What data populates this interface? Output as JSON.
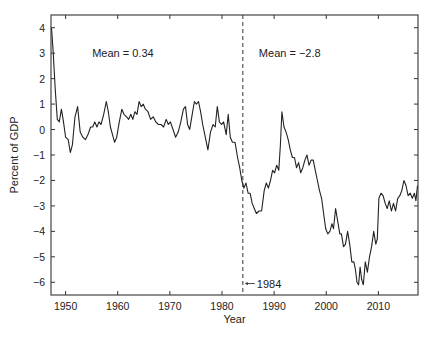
{
  "chart_data": {
    "type": "line",
    "title": "",
    "xlabel": "Year",
    "ylabel": "Percent of GDP",
    "xlim": [
      1947.2,
      2017.6
    ],
    "ylim": [
      -6.5,
      4.5
    ],
    "xticks": [
      1950,
      1960,
      1970,
      1980,
      1990,
      2000,
      2010
    ],
    "yticks": [
      4,
      3,
      2,
      1,
      0,
      -1,
      -2,
      -3,
      -4,
      -5,
      -6
    ],
    "grid": false,
    "legend": null,
    "annotations": [
      {
        "text": "Mean = 0.34",
        "x": 1961,
        "y": 2.85
      },
      {
        "text": "Mean = −2.8",
        "x": 1993,
        "y": 2.85
      },
      {
        "text": "1984",
        "x": 1984.3,
        "y": -6.05,
        "arrow": true
      }
    ],
    "vline": {
      "x": 1984,
      "style": "dashed"
    },
    "series": [
      {
        "name": "Percent of GDP",
        "color": "#222222",
        "points": [
          [
            1947.3,
            4.0
          ],
          [
            1947.6,
            3.1
          ],
          [
            1948.0,
            1.6
          ],
          [
            1948.4,
            0.4
          ],
          [
            1948.8,
            0.3
          ],
          [
            1949.2,
            0.8
          ],
          [
            1949.6,
            0.3
          ],
          [
            1950.0,
            -0.3
          ],
          [
            1950.5,
            -0.4
          ],
          [
            1950.9,
            -0.9
          ],
          [
            1951.3,
            -0.6
          ],
          [
            1951.8,
            0.5
          ],
          [
            1952.3,
            0.9
          ],
          [
            1952.8,
            -0.1
          ],
          [
            1953.3,
            -0.3
          ],
          [
            1953.8,
            -0.4
          ],
          [
            1954.3,
            -0.2
          ],
          [
            1954.8,
            0.1
          ],
          [
            1955.2,
            0.1
          ],
          [
            1955.6,
            0.3
          ],
          [
            1956.0,
            0.1
          ],
          [
            1956.4,
            0.3
          ],
          [
            1956.8,
            0.2
          ],
          [
            1957.3,
            0.6
          ],
          [
            1957.8,
            1.1
          ],
          [
            1958.2,
            0.7
          ],
          [
            1958.6,
            0.1
          ],
          [
            1959.0,
            -0.2
          ],
          [
            1959.4,
            -0.5
          ],
          [
            1959.8,
            -0.3
          ],
          [
            1960.3,
            0.3
          ],
          [
            1960.8,
            0.8
          ],
          [
            1961.2,
            0.6
          ],
          [
            1961.7,
            0.5
          ],
          [
            1962.1,
            0.4
          ],
          [
            1962.5,
            0.6
          ],
          [
            1962.9,
            0.4
          ],
          [
            1963.3,
            0.7
          ],
          [
            1963.7,
            0.6
          ],
          [
            1964.1,
            1.1
          ],
          [
            1964.5,
            0.9
          ],
          [
            1964.9,
            1.0
          ],
          [
            1965.3,
            0.8
          ],
          [
            1965.8,
            0.7
          ],
          [
            1966.3,
            0.4
          ],
          [
            1966.8,
            0.5
          ],
          [
            1967.3,
            0.3
          ],
          [
            1967.8,
            0.2
          ],
          [
            1968.3,
            0.2
          ],
          [
            1968.8,
            0.1
          ],
          [
            1969.3,
            0.4
          ],
          [
            1969.7,
            0.2
          ],
          [
            1970.1,
            0.3
          ],
          [
            1970.6,
            0.0
          ],
          [
            1971.1,
            -0.3
          ],
          [
            1971.6,
            -0.1
          ],
          [
            1972.1,
            0.3
          ],
          [
            1972.6,
            0.8
          ],
          [
            1973.0,
            0.9
          ],
          [
            1973.4,
            0.2
          ],
          [
            1973.8,
            0.0
          ],
          [
            1974.2,
            0.5
          ],
          [
            1974.7,
            1.1
          ],
          [
            1975.1,
            1.0
          ],
          [
            1975.5,
            1.1
          ],
          [
            1975.9,
            0.7
          ],
          [
            1976.3,
            0.2
          ],
          [
            1976.8,
            -0.3
          ],
          [
            1977.3,
            -0.8
          ],
          [
            1977.8,
            -0.1
          ],
          [
            1978.3,
            0.2
          ],
          [
            1978.7,
            0.1
          ],
          [
            1979.1,
            0.9
          ],
          [
            1979.5,
            0.3
          ],
          [
            1979.9,
            0.2
          ],
          [
            1980.3,
            0.3
          ],
          [
            1980.8,
            -0.2
          ],
          [
            1981.2,
            0.6
          ],
          [
            1981.6,
            -0.3
          ],
          [
            1982.0,
            -0.5
          ],
          [
            1982.5,
            -0.5
          ],
          [
            1983.0,
            -1.1
          ],
          [
            1983.4,
            -1.5
          ],
          [
            1983.8,
            -2.0
          ],
          [
            1984.2,
            -2.3
          ],
          [
            1984.6,
            -2.1
          ],
          [
            1985.0,
            -2.5
          ],
          [
            1985.4,
            -2.5
          ],
          [
            1985.8,
            -2.9
          ],
          [
            1986.2,
            -3.1
          ],
          [
            1986.6,
            -3.3
          ],
          [
            1987.1,
            -3.2
          ],
          [
            1987.6,
            -3.2
          ],
          [
            1988.1,
            -2.4
          ],
          [
            1988.5,
            -2.1
          ],
          [
            1988.9,
            -2.3
          ],
          [
            1989.3,
            -2.0
          ],
          [
            1989.7,
            -1.6
          ],
          [
            1990.1,
            -1.7
          ],
          [
            1990.5,
            -1.4
          ],
          [
            1990.9,
            -1.6
          ],
          [
            1991.2,
            -0.6
          ],
          [
            1991.5,
            0.7
          ],
          [
            1991.9,
            0.1
          ],
          [
            1992.3,
            -0.1
          ],
          [
            1992.7,
            -0.4
          ],
          [
            1993.1,
            -0.8
          ],
          [
            1993.5,
            -1.1
          ],
          [
            1993.9,
            -1.1
          ],
          [
            1994.3,
            -1.5
          ],
          [
            1994.7,
            -1.3
          ],
          [
            1995.1,
            -1.7
          ],
          [
            1995.5,
            -1.5
          ],
          [
            1995.9,
            -1.2
          ],
          [
            1996.3,
            -1.0
          ],
          [
            1996.7,
            -1.4
          ],
          [
            1997.1,
            -1.2
          ],
          [
            1997.5,
            -1.2
          ],
          [
            1997.9,
            -1.6
          ],
          [
            1998.3,
            -2.0
          ],
          [
            1998.7,
            -2.4
          ],
          [
            1999.1,
            -2.7
          ],
          [
            1999.5,
            -3.3
          ],
          [
            1999.9,
            -3.9
          ],
          [
            2000.3,
            -4.1
          ],
          [
            2000.7,
            -4.0
          ],
          [
            2001.1,
            -3.7
          ],
          [
            2001.4,
            -3.9
          ],
          [
            2001.8,
            -3.1
          ],
          [
            2002.2,
            -3.6
          ],
          [
            2002.6,
            -4.1
          ],
          [
            2002.9,
            -4.1
          ],
          [
            2003.3,
            -4.6
          ],
          [
            2003.7,
            -4.5
          ],
          [
            2004.1,
            -4.0
          ],
          [
            2004.5,
            -4.5
          ],
          [
            2004.9,
            -5.2
          ],
          [
            2005.3,
            -5.2
          ],
          [
            2005.6,
            -5.5
          ],
          [
            2005.9,
            -6.0
          ],
          [
            2006.2,
            -6.1
          ],
          [
            2006.5,
            -5.4
          ],
          [
            2006.8,
            -5.9
          ],
          [
            2007.1,
            -6.1
          ],
          [
            2007.5,
            -5.2
          ],
          [
            2007.9,
            -5.6
          ],
          [
            2008.3,
            -5.0
          ],
          [
            2008.7,
            -4.6
          ],
          [
            2009.1,
            -4.0
          ],
          [
            2009.5,
            -4.5
          ],
          [
            2009.8,
            -4.3
          ],
          [
            2010.1,
            -2.7
          ],
          [
            2010.5,
            -2.5
          ],
          [
            2010.9,
            -2.6
          ],
          [
            2011.3,
            -2.9
          ],
          [
            2011.7,
            -3.1
          ],
          [
            2012.1,
            -2.8
          ],
          [
            2012.5,
            -3.2
          ],
          [
            2012.9,
            -2.9
          ],
          [
            2013.3,
            -3.2
          ],
          [
            2013.7,
            -2.7
          ],
          [
            2014.1,
            -2.6
          ],
          [
            2014.5,
            -2.4
          ],
          [
            2014.9,
            -2.0
          ],
          [
            2015.3,
            -2.2
          ],
          [
            2015.7,
            -2.6
          ],
          [
            2016.1,
            -2.5
          ],
          [
            2016.5,
            -2.7
          ],
          [
            2016.9,
            -2.5
          ],
          [
            2017.2,
            -2.8
          ],
          [
            2017.5,
            -2.2
          ]
        ]
      }
    ]
  },
  "layout": {
    "plot_box": {
      "left": 51,
      "top": 15,
      "right": 418,
      "bottom": 295
    }
  }
}
